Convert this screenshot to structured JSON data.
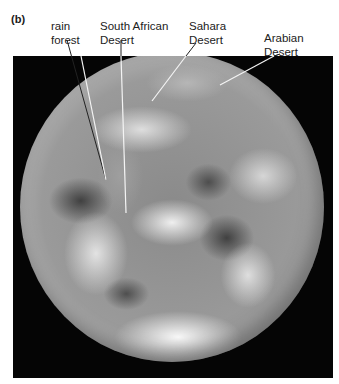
{
  "figure": {
    "panel_label": "(b)",
    "photo_description": "Satellite photograph of Earth (grayscale) showing Africa, the Arabian Peninsula and cloud cover",
    "colors": {
      "background": "#ffffff",
      "photo_frame": "#050505",
      "text": "#222222",
      "leader_line": "#ffffff"
    }
  },
  "callouts": [
    {
      "id": "rain-forest",
      "text": "rain\nforest"
    },
    {
      "id": "south-african-desert",
      "text": "South African\nDesert"
    },
    {
      "id": "sahara-desert",
      "text": "Sahara\nDesert"
    },
    {
      "id": "arabian-desert",
      "text": "Arabian\nDesert"
    }
  ]
}
